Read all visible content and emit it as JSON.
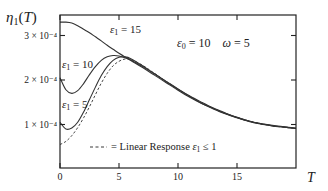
{
  "chart_data": {
    "type": "line",
    "title": "",
    "xlabel": "T",
    "ylabel": "η1(T)",
    "xlim": [
      0,
      20
    ],
    "ylim": [
      0,
      0.000346
    ],
    "x_ticks": [
      0,
      5,
      10,
      15
    ],
    "x_tick_labels": [
      "0",
      "5",
      "10",
      "15"
    ],
    "y_ticks": [
      0.0001,
      0.0002,
      0.0003
    ],
    "y_tick_labels": [
      "1 × 10⁻⁴",
      "2 × 10⁻⁴",
      "3 × 10⁻⁴"
    ],
    "grid": false,
    "annotations": {
      "params": "ε0 = 10    ω = 5",
      "legend_dashed": "= Linear Response ε1 ≤ 1",
      "curve_labels": [
        "ε1 = 15",
        "ε1 = 10",
        "ε1 = 5"
      ]
    },
    "x": [
      0,
      0.5,
      1,
      1.5,
      2,
      2.5,
      3,
      3.5,
      4,
      4.5,
      5,
      5.5,
      6,
      7,
      8,
      9,
      10,
      11,
      12,
      13,
      14,
      15,
      16,
      17,
      18,
      19,
      20
    ],
    "series": [
      {
        "name": "ε1 = 15",
        "style": "solid",
        "values": [
          3.3,
          3.3,
          3.28,
          3.22,
          3.14,
          3.06,
          2.97,
          2.88,
          2.78,
          2.69,
          2.6,
          2.52,
          2.45,
          2.3,
          2.14,
          1.97,
          1.8,
          1.64,
          1.5,
          1.37,
          1.26,
          1.16,
          1.08,
          1.02,
          0.98,
          0.95,
          0.92
        ]
      },
      {
        "name": "ε1 = 10",
        "style": "solid",
        "values": [
          2.05,
          1.78,
          1.7,
          1.76,
          1.92,
          2.12,
          2.3,
          2.44,
          2.52,
          2.55,
          2.54,
          2.5,
          2.44,
          2.28,
          2.11,
          1.94,
          1.77,
          1.61,
          1.47,
          1.35,
          1.24,
          1.15,
          1.07,
          1.01,
          0.97,
          0.94,
          0.91
        ]
      },
      {
        "name": "ε1 = 5",
        "style": "solid",
        "values": [
          1.05,
          0.9,
          0.92,
          1.05,
          1.28,
          1.56,
          1.84,
          2.1,
          2.3,
          2.44,
          2.51,
          2.52,
          2.48,
          2.32,
          2.14,
          1.96,
          1.79,
          1.63,
          1.48,
          1.36,
          1.25,
          1.16,
          1.08,
          1.02,
          0.97,
          0.94,
          0.91
        ]
      },
      {
        "name": "Linear Response ε1 ≤ 1",
        "style": "dashed",
        "values": [
          0.55,
          0.62,
          0.75,
          0.93,
          1.15,
          1.4,
          1.67,
          1.93,
          2.15,
          2.32,
          2.42,
          2.47,
          2.46,
          2.33,
          2.15,
          1.97,
          1.79,
          1.63,
          1.49,
          1.36,
          1.25,
          1.16,
          1.08,
          1.02,
          0.97,
          0.94,
          0.91
        ]
      }
    ],
    "value_scale": 0.0001,
    "legend_position": "inside-lower-right"
  }
}
